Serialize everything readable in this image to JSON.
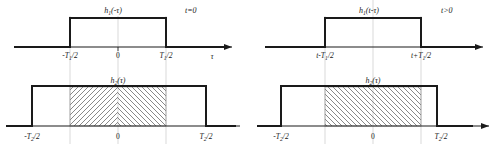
{
  "figure": {
    "kind": "convolution-overlap-diagram",
    "colors": {
      "curve": "#1a1a1a",
      "axis": "#1a1a1a",
      "guide": "#c9c9c9",
      "hatch": "#7a7a7a",
      "background": "#ffffff"
    }
  },
  "panels": [
    {
      "id": "left",
      "time_condition": "t=0",
      "top": {
        "signal_label": "h",
        "signal_sub": "1",
        "signal_arg": "(-τ)",
        "axis_label": "τ",
        "ticks": [
          {
            "text": "-T",
            "sub": "1",
            "rest": "/2"
          },
          {
            "text": "0",
            "sub": "",
            "rest": ""
          },
          {
            "text": "T",
            "sub": "1",
            "rest": "/2"
          }
        ]
      },
      "bottom": {
        "signal_label": "h",
        "signal_sub": "2",
        "signal_arg": "(τ)",
        "ticks": [
          {
            "text": "-T",
            "sub": "2",
            "rest": "/2"
          },
          {
            "text": "0",
            "sub": "",
            "rest": ""
          },
          {
            "text": "T",
            "sub": "2",
            "rest": "/2"
          }
        ],
        "hatch_directions": [
          "forward",
          "backward"
        ]
      }
    },
    {
      "id": "right",
      "time_condition": "t>0",
      "top": {
        "signal_label": "h",
        "signal_sub": "1",
        "signal_arg": "(t-τ)",
        "axis_label": "τ",
        "ticks": [
          {
            "text": "t-T",
            "sub": "1",
            "rest": "/2"
          },
          {
            "text": "",
            "sub": "",
            "rest": ""
          },
          {
            "text": "t+T",
            "sub": "1",
            "rest": "/2"
          }
        ]
      },
      "bottom": {
        "signal_label": "h",
        "signal_sub": "2",
        "signal_arg": "(τ)",
        "ticks": [
          {
            "text": "-T",
            "sub": "2",
            "rest": "/2"
          },
          {
            "text": "0",
            "sub": "",
            "rest": ""
          },
          {
            "text": "T",
            "sub": "2",
            "rest": "/2"
          }
        ],
        "hatch_directions": [
          "backward",
          "backward"
        ]
      }
    }
  ]
}
